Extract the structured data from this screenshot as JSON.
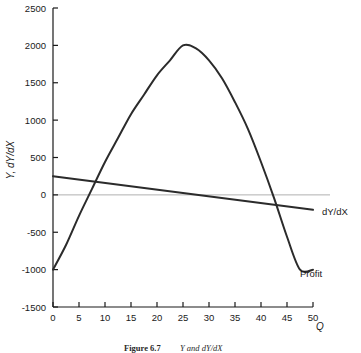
{
  "figure": {
    "caption_bold": "Figure 6.7",
    "caption_rest": "Y and dY/dX"
  },
  "chart_data": {
    "type": "line",
    "title": "",
    "xlabel": "Q",
    "ylabel": "Y, dY/dX",
    "xlim": [
      0,
      50
    ],
    "ylim": [
      -1500,
      2500
    ],
    "xticks": [
      0,
      5,
      10,
      15,
      20,
      25,
      30,
      35,
      40,
      45,
      50
    ],
    "xtick_labels": [
      "0",
      "5",
      "10",
      "15",
      "20",
      "25",
      "30",
      "35",
      "40",
      "45",
      "50"
    ],
    "yticks": [
      -1500,
      -1000,
      -500,
      0,
      500,
      1000,
      1500,
      2000,
      2500
    ],
    "ytick_labels": [
      "-1500",
      "-1000",
      "-500",
      "0",
      "500",
      "1000",
      "1500",
      "2000",
      "2500"
    ],
    "grid": false,
    "zero_reference_line": {
      "value": 0,
      "color": "#b0b0b0"
    },
    "legend_position": "inline-right",
    "series": [
      {
        "name": "Profit",
        "label": "Profit",
        "color": "#2b2b2b",
        "type": "curve",
        "x": [
          0,
          2.5,
          5,
          7.5,
          10,
          12.5,
          15,
          17.5,
          20,
          22.5,
          25,
          27.5,
          30,
          32.5,
          35,
          37.5,
          40,
          42.5,
          45,
          47.5,
          50
        ],
        "values": [
          -1000,
          -670,
          -280,
          80,
          440,
          760,
          1080,
          1340,
          1600,
          1800,
          2000,
          1960,
          1800,
          1560,
          1240,
          880,
          440,
          -40,
          -560,
          -1000,
          -1000
        ]
      },
      {
        "name": "dY/dX",
        "label": "dY/dX",
        "color": "#2b2b2b",
        "type": "line",
        "x": [
          0,
          50
        ],
        "values": [
          250,
          -200
        ]
      }
    ],
    "annotations": [
      {
        "text": "dY/dX",
        "x": 50,
        "y": -200,
        "position": "right"
      },
      {
        "text": "Profit",
        "x": 50,
        "y": -1000,
        "position": "right-below"
      }
    ]
  }
}
